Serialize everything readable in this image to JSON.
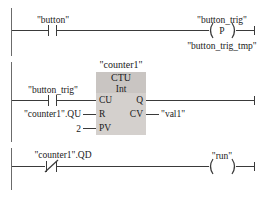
{
  "diagram": {
    "type": "ladder-logic",
    "language": "LAD",
    "rails": {
      "color": "#6b6b6b"
    },
    "wire_color": "#3a3a3a",
    "block_fill": "#d4d0cd",
    "block_header_fill": "#c9c5c2",
    "rungs": [
      {
        "id": "rung-1",
        "contacts": [
          {
            "name": "\"button\"",
            "kind": "NO"
          }
        ],
        "coil": {
          "kind": "positive-edge",
          "letter": "P",
          "label_top": "\"button_trig\"",
          "label_bottom": "\"button_trig_tmp\""
        }
      },
      {
        "id": "rung-2",
        "contacts": [
          {
            "name": "\"button_trig\"",
            "kind": "NO"
          }
        ],
        "block": {
          "instance": "\"counter1\"",
          "type": "CTU",
          "datatype": "Int",
          "inputs": [
            {
              "pin": "CU",
              "operand": ""
            },
            {
              "pin": "R",
              "operand": "\"counter1\".QU"
            },
            {
              "pin": "PV",
              "operand": "2"
            }
          ],
          "outputs": [
            {
              "pin": "Q",
              "operand": ""
            },
            {
              "pin": "CV",
              "operand": "\"val1\""
            }
          ]
        }
      },
      {
        "id": "rung-3",
        "contacts": [
          {
            "name": "\"counter1\".QD",
            "kind": "NC"
          }
        ],
        "coil": {
          "kind": "output",
          "letter": "",
          "label_top": "\"run\"",
          "label_bottom": ""
        }
      }
    ]
  }
}
